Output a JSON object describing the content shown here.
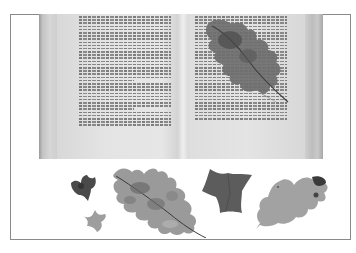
{
  "image": {
    "description": "Black-and-white photograph of an open hardcover book with a pressed oak leaf lying on the right page, and five pressed leaves (two small ivy leaves, a large oak leaf, an ivy leaf, and a pale oak leaf) arranged in a row below the book, enclosed in a thin gray rectangular border.",
    "border_color": "#8a8a8a",
    "background_color": "#ffffff"
  },
  "book": {
    "state": "open",
    "left_page": {
      "text": "illegible printed text, two paragraphs"
    },
    "right_page": {
      "text": "illegible printed text, partly covered by a pressed leaf"
    }
  },
  "leaves": [
    {
      "id": "book-oak-leaf",
      "type": "oak",
      "tone": "dark gray",
      "position": "on right page"
    },
    {
      "id": "small-ivy-dark",
      "type": "ivy",
      "tone": "dark gray",
      "position": "bottom row, far left, upper"
    },
    {
      "id": "small-ivy-light",
      "type": "ivy",
      "tone": "light gray",
      "position": "bottom row, far left, lower"
    },
    {
      "id": "large-oak-leaf",
      "type": "oak",
      "tone": "mottled gray",
      "position": "bottom row, second"
    },
    {
      "id": "ivy-leaf",
      "type": "ivy",
      "tone": "dark gray",
      "position": "bottom row, third"
    },
    {
      "id": "pale-oak-leaf",
      "type": "oak",
      "tone": "light gray with dark tip",
      "position": "bottom row, far right"
    }
  ]
}
